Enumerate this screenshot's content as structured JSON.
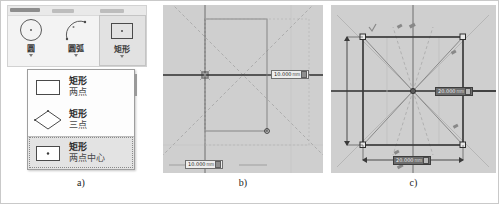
{
  "figure": {
    "panels": [
      {
        "caption": "a)"
      },
      {
        "caption": "b)"
      },
      {
        "caption": "c)"
      }
    ]
  },
  "ribbon": {
    "tools": [
      {
        "label": "圆",
        "icon": "circle-tool-icon",
        "selected": false
      },
      {
        "label": "圆弧",
        "icon": "arc-tool-icon",
        "selected": false
      },
      {
        "label": "矩形",
        "icon": "rectangle-tool-icon",
        "selected": true
      }
    ]
  },
  "flyout": {
    "items": [
      {
        "title": "矩形",
        "subtitle": "两点",
        "icon": "rectangle-two-point-icon",
        "active": false
      },
      {
        "title": "矩形",
        "subtitle": "三点",
        "icon": "rectangle-three-point-icon",
        "active": false
      },
      {
        "title": "矩形",
        "subtitle": "两点中心",
        "icon": "rectangle-center-two-point-icon",
        "active": true
      }
    ]
  },
  "panel_b": {
    "dim_width": {
      "value": "10.000",
      "unit": "mm",
      "focused": false
    },
    "dim_height": {
      "value": "10.000",
      "unit": "mm",
      "focused": true
    }
  },
  "panel_c": {
    "dim_width": {
      "value": "20.000",
      "unit": "mm",
      "focused": true
    },
    "dim_height": {
      "value": "20.000",
      "unit": "mm",
      "focused": false
    }
  },
  "colors": {
    "canvas": "#cfcfcf",
    "geometry": "#3b3b3b",
    "guide": "#9a9a9a",
    "accent_selected": "#e2e2e2"
  }
}
